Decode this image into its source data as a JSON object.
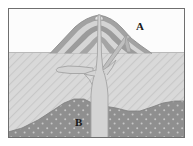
{
  "figure": {
    "type": "geological-cross-section",
    "width": 193,
    "height": 146
  },
  "frame": {
    "border_color": "#6b6b6b",
    "background_color": "#ffffff",
    "x": 8,
    "y": 8,
    "width": 177,
    "height": 130
  },
  "labels": [
    {
      "id": "A",
      "text": "A",
      "x": 140,
      "y": 27,
      "refers_to": "volcanic-cone-layered-strata"
    },
    {
      "id": "B",
      "text": "B",
      "x": 79,
      "y": 123,
      "refers_to": "deep-stippled-rock-body"
    }
  ],
  "regions": {
    "sky": {
      "name": "sky-above-ground",
      "color": "#fbfbfb",
      "top": 8,
      "bottom": 52
    },
    "crust": {
      "name": "hatched-crust-layer",
      "color": "#d6d6d6",
      "hatch_color": "#c4c4c4",
      "top": 52,
      "bottom": 138
    },
    "deep_body": {
      "name": "stippled-dark-rock-mound",
      "color": "#8e8e8e",
      "dot_color": "#c9c9c9",
      "top": 98,
      "bottom": 138
    }
  },
  "features": {
    "cone": {
      "name": "stratovolcano-cone",
      "summit_x": 99,
      "summit_y": 16,
      "base_left_x": 52,
      "base_right_x": 150,
      "base_y": 53,
      "layer_dark_color": "#9a9a9a",
      "layer_light_color": "#d2d2d2",
      "layer_count": 4
    },
    "conduit": {
      "name": "central-magma-conduit",
      "color": "#d0d0d0",
      "outline_color": "#a0a0a0",
      "top_y": 16,
      "bottom_y": 138,
      "top_width": 3,
      "bottom_width": 14
    },
    "sill": {
      "name": "left-laccolith-sill",
      "color": "#d0d0d0",
      "outline_color": "#a0a0a0",
      "x_left": 56,
      "x_right": 93,
      "y": 70
    },
    "dike": {
      "name": "right-flank-dike",
      "color": "#bdbdbd",
      "outline_color": "#9a9a9a",
      "from_x": 101,
      "from_y": 72,
      "to_x": 130,
      "to_y": 34
    }
  }
}
